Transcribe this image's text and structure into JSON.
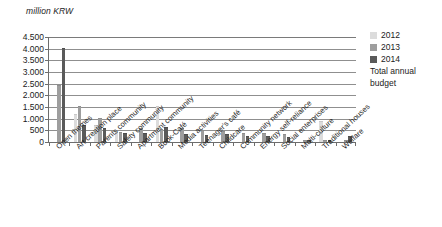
{
  "axis_unit_label": "million KRW",
  "legend": {
    "position": "right",
    "entries": [
      {
        "label": "2012",
        "color": "#dcdcdc",
        "icon": "legend-swatch"
      },
      {
        "label": "2013",
        "color": "#9e9e9e",
        "icon": "legend-swatch"
      },
      {
        "label": "2014",
        "color": "#5a5a5a",
        "icon": "legend-swatch"
      }
    ],
    "note_line1": "Total annual",
    "note_line2": "budget"
  },
  "chart_data": {
    "type": "bar",
    "title": "",
    "subtitle": "",
    "xlabel": "",
    "ylabel": "million KRW",
    "ylim": [
      0,
      4500
    ],
    "ytick_step": 500,
    "ytick_labels": [
      "4.500",
      "4.000",
      "3.500",
      "3.000",
      "2.500",
      "2.000",
      "1.500",
      "1.000",
      "500",
      "0"
    ],
    "ytick_values": [
      4500,
      4000,
      3500,
      3000,
      2500,
      2000,
      1500,
      1000,
      500,
      0
    ],
    "grid": true,
    "grid_axis": "y",
    "categories": [
      "Open themes",
      "Art creation place",
      "Parents community",
      "Safety community",
      "Apartment community",
      "Book-Café",
      "Media activities",
      "Teenager's café",
      "Childcare",
      "Community network",
      "Energy self-reliance",
      "Social enterprises",
      "Multi-culture",
      "Traditional houses",
      "Welfare"
    ],
    "series": [
      {
        "name": "2012",
        "color": "#dcdcdc",
        "values": [
          0,
          1150,
          700,
          390,
          0,
          1500,
          0,
          0,
          0,
          0,
          0,
          0,
          0,
          850,
          0
        ]
      },
      {
        "name": "2013",
        "color": "#9e9e9e",
        "values": [
          2400,
          1480,
          980,
          390,
          560,
          520,
          540,
          480,
          420,
          360,
          330,
          290,
          60,
          50,
          40
        ]
      },
      {
        "name": "2014",
        "color": "#5a5a5a",
        "values": [
          4000,
          680,
          540,
          330,
          350,
          580,
          280,
          250,
          300,
          230,
          200,
          170,
          40,
          30,
          230
        ]
      }
    ]
  }
}
